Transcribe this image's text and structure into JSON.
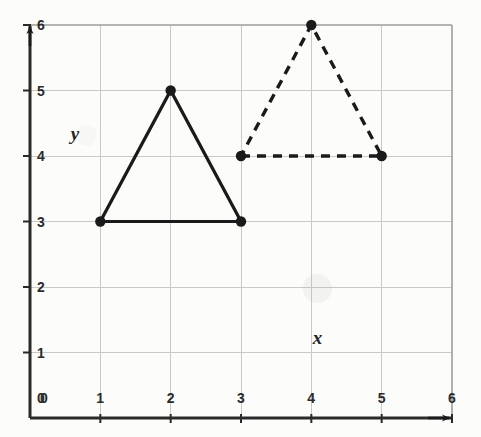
{
  "figure": {
    "background_color": "#fcfcfb",
    "ink_color": "#1a1a1a",
    "grid_color": "#c9c9c9",
    "axis_label_x": "x",
    "axis_label_y": "y"
  },
  "chart_data": {
    "type": "scatter",
    "title": "",
    "xlabel": "x",
    "ylabel": "y",
    "xlim": [
      0,
      6
    ],
    "ylim": [
      0,
      6
    ],
    "grid": true,
    "legend": "none",
    "xticks": [
      "0",
      "1",
      "2",
      "3",
      "4",
      "5",
      "6"
    ],
    "yticks": [
      "0",
      "1",
      "2",
      "3",
      "4",
      "5",
      "6"
    ],
    "xtick_values": [
      0,
      1,
      2,
      3,
      4,
      5,
      6
    ],
    "ytick_values": [
      0,
      1,
      2,
      3,
      4,
      5,
      6
    ],
    "series": [
      {
        "name": "solid-triangle",
        "style": "solid",
        "color": "#1a1a1a",
        "closed": true,
        "marker": "filled-circle",
        "points": [
          [
            1,
            3
          ],
          [
            3,
            3
          ],
          [
            2,
            5
          ]
        ]
      },
      {
        "name": "dashed-triangle",
        "style": "dashed",
        "color": "#1a1a1a",
        "closed": true,
        "marker": "filled-circle",
        "points": [
          [
            3,
            4
          ],
          [
            5,
            4
          ],
          [
            4,
            6
          ]
        ]
      }
    ],
    "annotations": [
      {
        "name": "x-axis-name",
        "text": "x",
        "x": 4.12,
        "y": 1.2,
        "italic": true
      },
      {
        "name": "y-axis-name",
        "text": "y",
        "x": 0.68,
        "y": 4.32,
        "italic": true
      }
    ],
    "axis_arrows": {
      "x_right": true,
      "y_top": true
    }
  }
}
